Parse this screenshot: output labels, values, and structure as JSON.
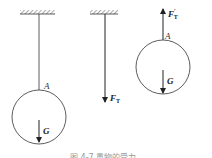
{
  "figure": {
    "caption": "图 4-7  重物的受力",
    "panels": [
      {
        "name": "suspended-ball",
        "point_label": "A",
        "weight_label": "G"
      },
      {
        "name": "rope-free-body",
        "force_label": "F",
        "force_subscript": "T"
      },
      {
        "name": "ball-free-body",
        "force_label": "F",
        "force_subscript": "T",
        "force_prime": "′",
        "point_label": "A",
        "weight_label": "G"
      }
    ]
  }
}
